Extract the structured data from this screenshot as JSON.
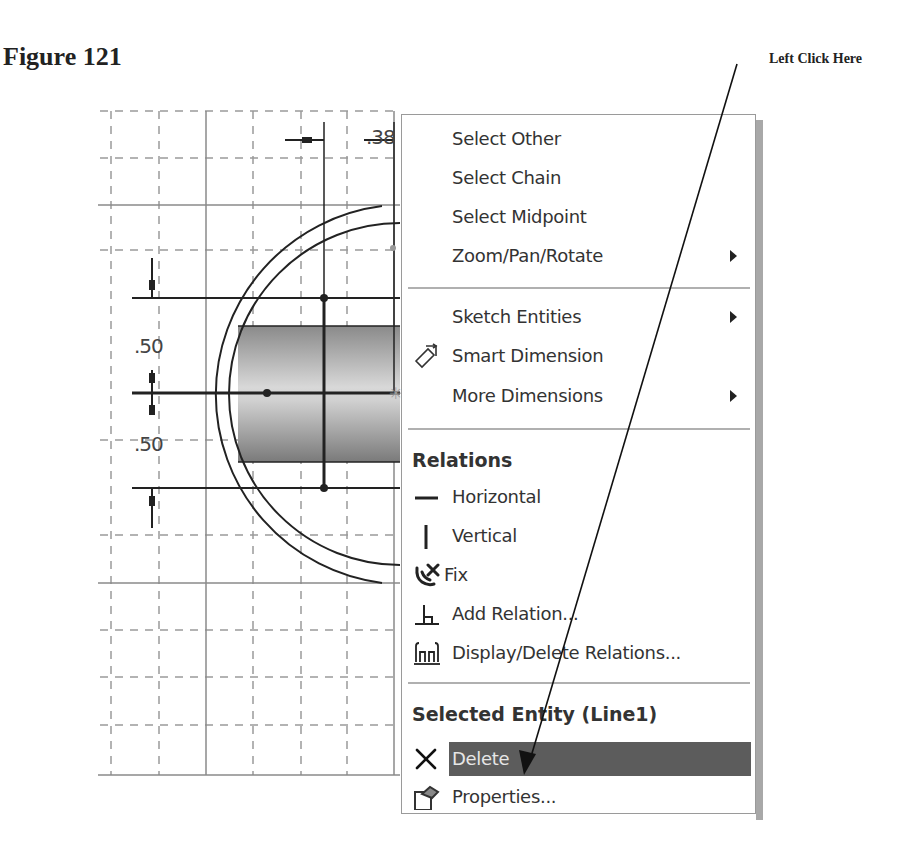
{
  "figure": {
    "title": "Figure 121",
    "callout": "Left Click Here"
  },
  "sketch": {
    "dimensions": [
      {
        "id": "horizontal-dim",
        "value": ".38"
      },
      {
        "id": "vertical-dim-upper",
        "value": ".50"
      },
      {
        "id": "vertical-dim-lower",
        "value": ".50"
      }
    ]
  },
  "context_menu": {
    "groups": [
      {
        "items": [
          {
            "label": "Select Other",
            "icon": "",
            "submenu": false
          },
          {
            "label": "Select Chain",
            "icon": "",
            "submenu": false
          },
          {
            "label": "Select Midpoint",
            "icon": "",
            "submenu": false
          },
          {
            "label": "Zoom/Pan/Rotate",
            "icon": "",
            "submenu": true
          }
        ]
      },
      {
        "items": [
          {
            "label": "Sketch Entities",
            "icon": "",
            "submenu": true
          },
          {
            "label": "Smart Dimension",
            "icon": "smart-dimension-icon",
            "submenu": false
          },
          {
            "label": "More Dimensions",
            "icon": "",
            "submenu": true
          }
        ]
      },
      {
        "header": "Relations",
        "items": [
          {
            "label": "Horizontal",
            "icon": "horizontal-relation-icon",
            "submenu": false
          },
          {
            "label": "Vertical",
            "icon": "vertical-relation-icon",
            "submenu": false
          },
          {
            "label": "Fix",
            "icon": "fix-relation-icon",
            "submenu": false
          },
          {
            "label": "Add Relation...",
            "icon": "add-relation-icon",
            "submenu": false
          },
          {
            "label": "Display/Delete Relations...",
            "icon": "display-delete-relations-icon",
            "submenu": false
          }
        ]
      },
      {
        "header": "Selected Entity (Line1)",
        "items": [
          {
            "label": "Delete",
            "icon": "delete-icon",
            "submenu": false,
            "highlighted": true
          },
          {
            "label": "Properties...",
            "icon": "properties-icon",
            "submenu": false
          }
        ]
      }
    ]
  },
  "colors": {
    "highlight": "#5c5c5c",
    "highlight_text": "#e6e6e6",
    "menu_border": "#9a9a9a",
    "grid": "#9a9a9a"
  }
}
